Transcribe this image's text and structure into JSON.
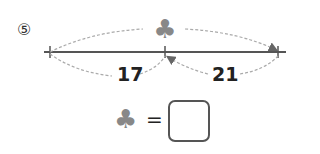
{
  "problem": {
    "number": "⑤",
    "unknown_symbol": "♣",
    "segments": [
      {
        "label": "17"
      },
      {
        "label": "21"
      }
    ],
    "equation": {
      "symbol": "♣",
      "equals": "=",
      "answer": ""
    }
  },
  "colors": {
    "line": "#555555",
    "arc": "#aaaaaa",
    "club": "#888888"
  }
}
